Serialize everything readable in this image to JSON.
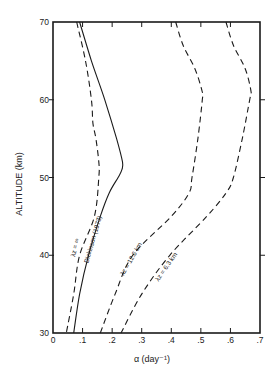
{
  "chart_data": {
    "type": "line",
    "title": "",
    "xlabel": "α (day⁻¹)",
    "ylabel": "ALTITUDE (km)",
    "xlim": [
      0,
      0.7
    ],
    "ylim": [
      30,
      70
    ],
    "x_ticks": [
      "0",
      ".1",
      ".2",
      ".3",
      ".4",
      ".5",
      ".6",
      ".7"
    ],
    "x_tick_values": [
      0,
      0.1,
      0.2,
      0.3,
      0.4,
      0.5,
      0.6,
      0.7
    ],
    "y_ticks": [
      "30",
      "40",
      "50",
      "60",
      "70"
    ],
    "y_tick_values": [
      30,
      40,
      50,
      60,
      70
    ],
    "grid": false,
    "legend": "inline curve labels",
    "series": [
      {
        "name": "λz = ∞",
        "style": "dashed",
        "altitude": [
          70,
          65,
          60,
          57,
          55,
          52,
          50,
          45,
          40,
          35,
          30
        ],
        "alpha": [
          0.08,
          0.11,
          0.13,
          0.135,
          0.145,
          0.155,
          0.155,
          0.14,
          0.09,
          0.07,
          0.045
        ]
      },
      {
        "name": "Dickinson (1973)",
        "style": "solid",
        "altitude": [
          70,
          65,
          60,
          55,
          52,
          51,
          50,
          48,
          45,
          40,
          35,
          30
        ],
        "alpha": [
          0.09,
          0.13,
          0.175,
          0.215,
          0.235,
          0.233,
          0.22,
          0.19,
          0.16,
          0.12,
          0.09,
          0.07
        ]
      },
      {
        "name": "λz = 12.6 km",
        "style": "dashed",
        "altitude": [
          70,
          67,
          64,
          61,
          60,
          55,
          50,
          48,
          45,
          40,
          35,
          30
        ],
        "alpha": [
          0.415,
          0.44,
          0.48,
          0.505,
          0.505,
          0.49,
          0.47,
          0.46,
          0.4,
          0.27,
          0.21,
          0.16
        ]
      },
      {
        "name": "λz = 6.3 km",
        "style": "dashed",
        "altitude": [
          70,
          67,
          64,
          61,
          60,
          55,
          50,
          48,
          45,
          40,
          35,
          30
        ],
        "alpha": [
          0.585,
          0.61,
          0.65,
          0.67,
          0.665,
          0.64,
          0.61,
          0.585,
          0.52,
          0.395,
          0.3,
          0.23
        ]
      }
    ]
  },
  "labels": {
    "lambda_inf": "λz = ∞",
    "dickinson": "Dickinson (1973)",
    "lambda_126": "λz = 12.6 km",
    "lambda_63": "λz = 6.3 km"
  },
  "colors": {
    "ink": "#1a1a1a",
    "background": "#ffffff"
  }
}
